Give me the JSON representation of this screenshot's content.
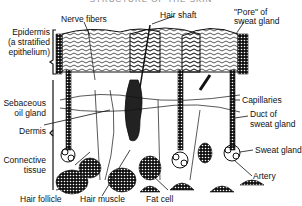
{
  "title": "STRUCTURE OF THE SKIN",
  "labels": {
    "nerve_fibers": "Nerve fibers",
    "hair_shaft": "Hair shaft",
    "pore_line1": "\"Pore\" of",
    "pore_line2": "sweat gland",
    "epidermis_line1": "Epidermis",
    "epidermis_line2": "(a stratified",
    "epidermis_line3": "epithelium)",
    "sebaceous_line1": "Sebaceous",
    "sebaceous_line2": "oil gland",
    "dermis": "Dermis",
    "connective_line1": "Connective",
    "connective_line2": "tissue",
    "capillaries": "Capillaries",
    "duct_line1": "Duct of",
    "duct_line2": "sweat gland",
    "sweat_gland": "Sweat gland",
    "artery": "Artery",
    "hair_follicle": "Hair follicle",
    "hair_muscle": "Hair muscle",
    "fat_cell": "Fat cell"
  },
  "colors": {
    "ink": "#111111",
    "background": "#ffffff"
  }
}
